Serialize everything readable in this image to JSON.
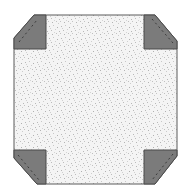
{
  "diagram": {
    "colors": {
      "background": "#ffffff",
      "fill_base": "#f4f4f4",
      "speckle": "#b8b8b8",
      "corner_fill": "#7b7b7b",
      "outline": "#5a5a5a",
      "dash": "#3c3c3c"
    },
    "octagon_points": "34,15 155,15 177,41 177,156 155,184 37,184 14,158 14,38",
    "corners": [
      {
        "name": "top-left",
        "polygon": "14,38 34,15 46,15 46,49 14,49",
        "dash": "19,42 37,20"
      },
      {
        "name": "top-right",
        "polygon": "144,15 155,15 177,41 177,49 144,49",
        "dash": "152,19 173,43"
      },
      {
        "name": "bottom-left",
        "polygon": "14,150 46,150 46,184 37,184 14,158",
        "dash": "18,155 39,180"
      },
      {
        "name": "bottom-right",
        "polygon": "144,150 177,150 177,156 155,184 144,184",
        "dash": "173,154 152,180"
      }
    ]
  }
}
